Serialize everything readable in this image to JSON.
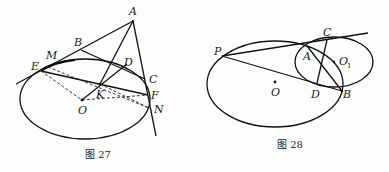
{
  "figures": [
    {
      "id": "fig27",
      "caption": "图 27",
      "points": {
        "A": "A",
        "B": "B",
        "M": "M",
        "E": "E",
        "D": "D",
        "C": "C",
        "K": "K",
        "F": "F",
        "O": "O",
        "N": "N"
      }
    },
    {
      "id": "fig28",
      "caption": "图 28",
      "points": {
        "P": "P",
        "C": "C",
        "A": "A",
        "O1": "O",
        "O1_sub": "1",
        "D": "D",
        "B": "B",
        "O": "O"
      }
    }
  ],
  "colors": {
    "ink": "#111111",
    "background": "#fdfdfd"
  }
}
